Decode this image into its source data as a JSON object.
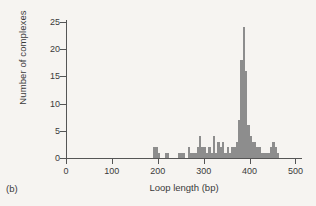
{
  "figure": {
    "panel_label": "(b)",
    "bar_color": "#8d8d8d",
    "axis_color": "#555555",
    "background_color": "#f6f4f1"
  },
  "chart_data": {
    "type": "bar",
    "title": "",
    "subtitle": "",
    "xlabel": "Loop length (bp)",
    "ylabel": "Number of complexes",
    "xlim": [
      0,
      510
    ],
    "ylim": [
      0,
      25
    ],
    "grid": false,
    "legend": null,
    "x_ticks": [
      0,
      100,
      200,
      300,
      400,
      500
    ],
    "x_tick_labels": [
      "0",
      "100",
      "200",
      "300",
      "400",
      "500"
    ],
    "y_ticks": [
      0,
      5,
      10,
      15,
      20,
      25
    ],
    "y_tick_labels": [
      "0",
      "5",
      "10",
      "15",
      "20",
      "25"
    ],
    "bin_width": 5,
    "bin_starts": [
      190,
      195,
      200,
      215,
      220,
      245,
      250,
      255,
      265,
      270,
      275,
      280,
      285,
      290,
      295,
      300,
      305,
      310,
      315,
      320,
      325,
      330,
      335,
      340,
      345,
      350,
      355,
      360,
      365,
      370,
      375,
      380,
      385,
      390,
      395,
      400,
      405,
      410,
      415,
      420,
      425,
      430,
      435,
      440,
      445,
      450,
      455,
      460
    ],
    "values": [
      2,
      2,
      1,
      1,
      1,
      1,
      1,
      1,
      2,
      1,
      1,
      1,
      2,
      4,
      2,
      2,
      1,
      2,
      1,
      4,
      1,
      3,
      2,
      3,
      1,
      2,
      1,
      2,
      2,
      3,
      7,
      18,
      24,
      16,
      6,
      4,
      3,
      3,
      2,
      2,
      1,
      1,
      1,
      1,
      2,
      3,
      2,
      1
    ],
    "peak": {
      "x": 385,
      "y": 24
    }
  }
}
